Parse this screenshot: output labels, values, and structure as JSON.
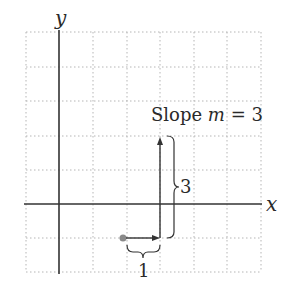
{
  "diagram": {
    "type": "slope-illustration",
    "axes": {
      "x_label": "x",
      "y_label": "y"
    },
    "grid": {
      "columns": 7,
      "rows": 7,
      "style": "dotted"
    },
    "title_parts": {
      "prefix": "Slope ",
      "var": "m",
      "suffix": " = 3"
    },
    "run_label": "1",
    "rise_label": "3",
    "start_point": {
      "x": 2,
      "y": -1
    },
    "run": 1,
    "rise": 3,
    "colors": {
      "axis": "#333333",
      "grid": "#b0b0b0",
      "point": "#888888",
      "arrow": "#333333"
    }
  }
}
